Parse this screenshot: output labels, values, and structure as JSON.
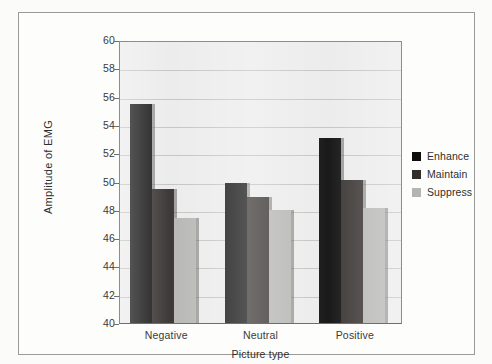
{
  "figure": {
    "y_axis_title": "Amplitude of EMG",
    "x_axis_title": "Picture type"
  },
  "legend": {
    "items": [
      {
        "label": "Enhance",
        "color": "#0d0d0d"
      },
      {
        "label": "Maintain",
        "color": "#332e2c"
      },
      {
        "label": "Suppress",
        "color": "#b4b4b2"
      }
    ]
  },
  "axis": {
    "y_ticks": [
      "60",
      "58",
      "56",
      "54",
      "52",
      "50",
      "48",
      "46",
      "44",
      "42",
      "40"
    ],
    "x_ticks": [
      "Negative",
      "Neutral",
      "Positive"
    ]
  },
  "chart_data": {
    "type": "bar",
    "title": "",
    "subtitle": "",
    "xlabel": "Picture type",
    "ylabel": "Amplitude of EMG",
    "categories": [
      "Negative",
      "Neutral",
      "Positive"
    ],
    "series": [
      {
        "name": "Enhance",
        "color": "#0d0d0d",
        "values": [
          55.5,
          49.9,
          53.1
        ]
      },
      {
        "name": "Maintain",
        "color": "#332e2c",
        "values": [
          49.5,
          48.9,
          50.1
        ]
      },
      {
        "name": "Suppress",
        "color": "#b4b4b2",
        "values": [
          47.4,
          48.0,
          48.1
        ]
      }
    ],
    "ylim": [
      40,
      60
    ],
    "ytick_step": 2,
    "ytick_values": [
      40,
      42,
      44,
      46,
      48,
      50,
      52,
      54,
      56,
      58,
      60
    ],
    "grid": "horizontal",
    "legend_position": "right",
    "annotations": []
  }
}
